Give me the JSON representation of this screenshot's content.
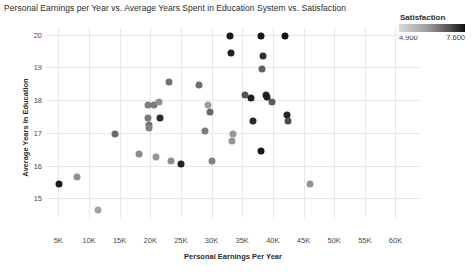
{
  "chart_data": {
    "type": "scatter",
    "title": "Personal Earnings per Year vs. Average Years Spent in Education System vs. Satisfaction",
    "xlabel": "Personal Earnings Per Year",
    "ylabel": "Average Years In Education",
    "xlim": [
      3000,
      64000
    ],
    "ylim": [
      14.4,
      20.2
    ],
    "xtick_labels": [
      "5K",
      "10K",
      "15K",
      "20K",
      "25K",
      "30K",
      "35K",
      "40K",
      "45K",
      "50K",
      "55K",
      "60K"
    ],
    "xtick_values": [
      5000,
      10000,
      15000,
      20000,
      25000,
      30000,
      35000,
      40000,
      45000,
      50000,
      55000,
      60000
    ],
    "ytick_labels": [
      "15",
      "16",
      "17",
      "18",
      "19",
      "20"
    ],
    "ytick_values": [
      15,
      16,
      17,
      18,
      19,
      20
    ],
    "grid": true,
    "legend": {
      "title": "Satisfaction",
      "min_label": "4.900",
      "max_label": "7.600",
      "min_value": 4.9,
      "max_value": 7.6,
      "position": "top-right",
      "colormap": "grayscale-light-to-dark",
      "color_low": "#d9d9d9",
      "color_high": "#111111"
    },
    "color_encoding": "Satisfaction",
    "points": [
      {
        "x": 5200,
        "y": 15.45,
        "satisfaction": 7.5,
        "color": "#1c1c1c"
      },
      {
        "x": 8000,
        "y": 15.65,
        "satisfaction": 5.6,
        "color": "#8f8f8f"
      },
      {
        "x": 11500,
        "y": 14.65,
        "satisfaction": 5.3,
        "color": "#a3a3a3"
      },
      {
        "x": 14200,
        "y": 16.95,
        "satisfaction": 6.3,
        "color": "#6a6a6a"
      },
      {
        "x": 18200,
        "y": 16.35,
        "satisfaction": 5.7,
        "color": "#8a8a8a"
      },
      {
        "x": 19600,
        "y": 17.85,
        "satisfaction": 5.9,
        "color": "#7e7e7e"
      },
      {
        "x": 19700,
        "y": 17.45,
        "satisfaction": 6.0,
        "color": "#787878"
      },
      {
        "x": 19750,
        "y": 17.25,
        "satisfaction": 6.1,
        "color": "#6f6f6f"
      },
      {
        "x": 19800,
        "y": 17.15,
        "satisfaction": 5.8,
        "color": "#858585"
      },
      {
        "x": 20600,
        "y": 17.85,
        "satisfaction": 6.0,
        "color": "#7a7a7a"
      },
      {
        "x": 21500,
        "y": 17.95,
        "satisfaction": 5.6,
        "color": "#909090"
      },
      {
        "x": 21600,
        "y": 17.45,
        "satisfaction": 7.3,
        "color": "#2b2b2b"
      },
      {
        "x": 21000,
        "y": 16.25,
        "satisfaction": 5.5,
        "color": "#979797"
      },
      {
        "x": 23000,
        "y": 18.55,
        "satisfaction": 6.1,
        "color": "#737373"
      },
      {
        "x": 23400,
        "y": 16.15,
        "satisfaction": 5.6,
        "color": "#8e8e8e"
      },
      {
        "x": 25000,
        "y": 16.05,
        "satisfaction": 7.4,
        "color": "#222222"
      },
      {
        "x": 28000,
        "y": 18.45,
        "satisfaction": 6.2,
        "color": "#6e6e6e"
      },
      {
        "x": 29500,
        "y": 17.85,
        "satisfaction": 5.4,
        "color": "#9c9c9c"
      },
      {
        "x": 29700,
        "y": 17.65,
        "satisfaction": 6.3,
        "color": "#686868"
      },
      {
        "x": 29000,
        "y": 17.05,
        "satisfaction": 5.9,
        "color": "#7c7c7c"
      },
      {
        "x": 30000,
        "y": 16.15,
        "satisfaction": 5.8,
        "color": "#828282"
      },
      {
        "x": 33000,
        "y": 19.95,
        "satisfaction": 7.5,
        "color": "#191919"
      },
      {
        "x": 33200,
        "y": 19.45,
        "satisfaction": 7.4,
        "color": "#202020"
      },
      {
        "x": 33500,
        "y": 16.95,
        "satisfaction": 5.4,
        "color": "#999999"
      },
      {
        "x": 33400,
        "y": 16.75,
        "satisfaction": 5.5,
        "color": "#959595"
      },
      {
        "x": 35500,
        "y": 18.15,
        "satisfaction": 6.6,
        "color": "#545454"
      },
      {
        "x": 36400,
        "y": 18.05,
        "satisfaction": 7.4,
        "color": "#1f1f1f"
      },
      {
        "x": 36800,
        "y": 17.35,
        "satisfaction": 7.3,
        "color": "#2a2a2a"
      },
      {
        "x": 38000,
        "y": 19.95,
        "satisfaction": 7.5,
        "color": "#161616"
      },
      {
        "x": 38400,
        "y": 19.35,
        "satisfaction": 7.2,
        "color": "#303030"
      },
      {
        "x": 38200,
        "y": 18.95,
        "satisfaction": 6.4,
        "color": "#636363"
      },
      {
        "x": 38900,
        "y": 18.15,
        "satisfaction": 7.3,
        "color": "#272727"
      },
      {
        "x": 39100,
        "y": 18.1,
        "satisfaction": 7.4,
        "color": "#1d1d1d"
      },
      {
        "x": 39900,
        "y": 17.95,
        "satisfaction": 6.5,
        "color": "#5c5c5c"
      },
      {
        "x": 38100,
        "y": 16.45,
        "satisfaction": 7.5,
        "color": "#181818"
      },
      {
        "x": 42000,
        "y": 19.95,
        "satisfaction": 7.5,
        "color": "#151515"
      },
      {
        "x": 42300,
        "y": 17.55,
        "satisfaction": 7.3,
        "color": "#242424"
      },
      {
        "x": 42400,
        "y": 17.35,
        "satisfaction": 6.7,
        "color": "#4d4d4d"
      },
      {
        "x": 46000,
        "y": 15.45,
        "satisfaction": 5.5,
        "color": "#959595"
      }
    ]
  }
}
